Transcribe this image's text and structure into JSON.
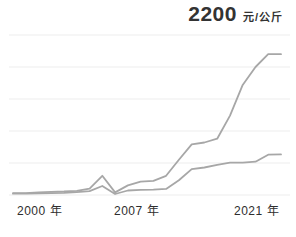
{
  "title": {
    "value": "2200",
    "unit": "元/公斤"
  },
  "x_axis_labels": [
    {
      "text": "2000 年"
    },
    {
      "text": "2007 年"
    },
    {
      "text": "2021 年"
    }
  ],
  "colors": {
    "background": "#ffffff",
    "line": "#a7a7a7",
    "grid": "#ededed",
    "title_text": "#333333",
    "axis_text": "#2e2e2e"
  },
  "chart_data": {
    "type": "line",
    "title": "2200 元/公斤",
    "xlabel": "年",
    "ylabel": "元/公斤",
    "x": [
      2000,
      2001,
      2002,
      2003,
      2004,
      2005,
      2006,
      2007,
      2008,
      2009,
      2010,
      2011,
      2012,
      2013,
      2014,
      2015,
      2016,
      2017,
      2018,
      2019,
      2020,
      2021
    ],
    "series": [
      {
        "name": "upper-price-line",
        "values": [
          30,
          30,
          40,
          50,
          55,
          65,
          100,
          300,
          40,
          150,
          210,
          220,
          300,
          550,
          790,
          820,
          880,
          1240,
          1720,
          2000,
          2200,
          2200
        ]
      },
      {
        "name": "lower-price-line",
        "values": [
          20,
          20,
          25,
          30,
          35,
          45,
          60,
          140,
          15,
          70,
          80,
          85,
          95,
          230,
          405,
          430,
          470,
          505,
          505,
          520,
          630,
          635
        ]
      }
    ],
    "xlim": [
      2000,
      2021
    ],
    "ylim": [
      0,
      2500
    ],
    "gridline_values": [
      0,
      500,
      1000,
      1500,
      2000,
      2500
    ],
    "grid": "horizontal-only",
    "legend": "none",
    "x_tick_labels_visible": [
      "2000 年",
      "2007 年",
      "2021 年"
    ]
  }
}
